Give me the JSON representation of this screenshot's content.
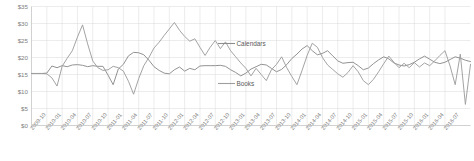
{
  "chart_data": {
    "type": "line",
    "title": "",
    "xlabel": "",
    "ylabel": "",
    "ylim": [
      0,
      35
    ],
    "ytick_values": [
      0,
      5,
      10,
      15,
      20,
      25,
      30,
      35
    ],
    "ytick_labels": [
      "$0",
      "$5",
      "$10",
      "$15",
      "$20",
      "$25",
      "$30",
      "$35"
    ],
    "grid": true,
    "legend_position": "inside-center-right",
    "x_tick_labels": [
      "2009-10",
      "2010-01",
      "2010-04",
      "2010-07",
      "2010-10",
      "2011-01",
      "2011-04",
      "2011-07",
      "2011-10",
      "2012-01",
      "2012-04",
      "2012-07",
      "2012-10",
      "2013-01",
      "2013-04",
      "2013-07",
      "2013-10",
      "2014-01",
      "2014-04",
      "2014-07",
      "2014-10",
      "2015-01",
      "2015-04",
      "2015-07",
      "2015-10",
      "2016-01",
      "2016-04",
      "2016-07"
    ],
    "x_tick_interval_months": 3,
    "x_start": "2009-10",
    "x_end": "2016-07",
    "series": [
      {
        "name": "Calendars",
        "color": "#8c8c8c",
        "values": [
          15.3,
          15.3,
          15.3,
          15.4,
          17.5,
          17.0,
          17.6,
          17.3,
          17.8,
          17.9,
          17.7,
          17.3,
          17.6,
          17.4,
          17.4,
          14.8,
          12.0,
          16.6,
          18.0,
          20.5,
          21.5,
          21.4,
          20.8,
          19.2,
          17.3,
          16.2,
          15.4,
          15.2,
          16.4,
          17.2,
          16.0,
          16.8,
          16.4,
          17.5,
          17.6,
          17.6,
          17.6,
          17.7,
          17.4,
          16.4,
          15.6,
          14.6,
          15.4,
          16.6,
          17.3,
          18.0,
          17.8,
          16.8,
          15.8,
          16.5,
          17.9,
          19.7,
          21.0,
          22.5,
          23.5,
          22.0,
          20.8,
          21.2,
          22.0,
          20.5,
          19.0,
          18.3,
          18.5,
          18.6,
          17.6,
          16.4,
          16.9,
          18.2,
          19.3,
          20.2,
          19.6,
          18.4,
          17.8,
          17.5,
          17.9,
          18.6,
          19.6,
          20.4,
          19.5,
          18.6,
          18.2,
          18.6,
          19.4,
          20.2,
          19.8,
          19.2,
          18.8
        ]
      },
      {
        "name": "Books",
        "color": "#9e9e9e",
        "values": [
          15.3,
          15.3,
          15.3,
          15.2,
          14.0,
          11.6,
          17.4,
          19.8,
          22.0,
          26.0,
          29.6,
          24.0,
          19.0,
          17.0,
          16.2,
          16.4,
          17.4,
          17.0,
          16.0,
          13.0,
          9.2,
          13.8,
          17.6,
          20.0,
          22.8,
          24.5,
          26.5,
          28.4,
          30.3,
          28.0,
          26.2,
          24.8,
          25.5,
          23.0,
          20.6,
          23.0,
          25.0,
          22.6,
          24.6,
          22.0,
          20.2,
          18.4,
          16.8,
          14.6,
          16.8,
          15.0,
          13.2,
          16.4,
          18.0,
          20.2,
          17.0,
          14.4,
          12.0,
          16.2,
          20.6,
          24.2,
          23.0,
          20.0,
          17.8,
          16.5,
          15.2,
          14.2,
          15.6,
          17.6,
          15.8,
          13.2,
          12.0,
          13.6,
          15.8,
          18.2,
          20.4,
          18.6,
          17.0,
          18.3,
          17.0,
          18.5,
          17.2,
          18.4,
          17.6,
          19.0,
          20.6,
          22.0,
          17.5,
          12.0,
          21.0,
          6.2,
          18.0
        ]
      }
    ]
  },
  "legend": {
    "items": [
      {
        "label": "Calendars"
      },
      {
        "label": "Books"
      }
    ]
  }
}
